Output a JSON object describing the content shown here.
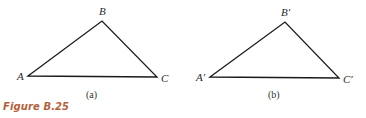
{
  "figure": {
    "caption": "Figure B.25",
    "caption_color": "#b5603a",
    "panels": [
      {
        "sublabel": "(a)",
        "vertices": {
          "A": {
            "label": "A",
            "x": 28,
            "y": 76
          },
          "B": {
            "label": "B",
            "x": 102,
            "y": 21
          },
          "C": {
            "label": "C",
            "x": 157,
            "y": 77
          }
        }
      },
      {
        "sublabel": "(b)",
        "vertices": {
          "A": {
            "label": "A′",
            "x": 210,
            "y": 77
          },
          "B": {
            "label": "B′",
            "x": 285,
            "y": 22
          },
          "C": {
            "label": "C′",
            "x": 339,
            "y": 78
          }
        }
      }
    ]
  }
}
